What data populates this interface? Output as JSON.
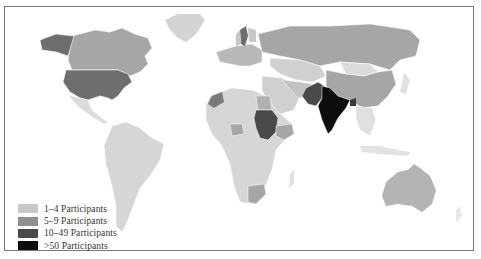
{
  "map": {
    "type": "choropleth world map",
    "subject": "Participants by country"
  },
  "legend": {
    "items": [
      {
        "label": "1–4 Participants",
        "color": "#c8c8c8"
      },
      {
        "label": "5–9 Participants",
        "color": "#8f8f8f"
      },
      {
        "label": "10–49 Participants",
        "color": "#4a4a4a"
      },
      {
        "label": ">50 Participants",
        "color": "#0d0d0d"
      }
    ]
  },
  "colors": {
    "no_data": "#ececec",
    "tier1": "#c8c8c8",
    "tier2": "#a6a6a6",
    "tier3": "#4a4a4a",
    "tier4": "#0d0d0d",
    "frame": "#7a7a7a"
  },
  "regions": [
    {
      "name": "United States",
      "tier": "10–49 Participants"
    },
    {
      "name": "Alaska",
      "tier": "10–49 Participants"
    },
    {
      "name": "Canada",
      "tier": "5–9 Participants"
    },
    {
      "name": "Mexico",
      "tier": "1–4 Participants"
    },
    {
      "name": "South America",
      "tier": "1–4 Participants"
    },
    {
      "name": "Russia",
      "tier": "5–9 Participants"
    },
    {
      "name": "China",
      "tier": "5–9 Participants"
    },
    {
      "name": "Mongolia",
      "tier": "1–4 Participants"
    },
    {
      "name": "India",
      "tier": ">50 Participants"
    },
    {
      "name": "Pakistan",
      "tier": "10–49 Participants"
    },
    {
      "name": "Sudan",
      "tier": "10–49 Participants"
    },
    {
      "name": "Ethiopia",
      "tier": "5–9 Participants"
    },
    {
      "name": "Nigeria",
      "tier": "5–9 Participants"
    },
    {
      "name": "South Africa",
      "tier": "5–9 Participants"
    },
    {
      "name": "Australia",
      "tier": "5–9 Participants"
    },
    {
      "name": "Sweden",
      "tier": "10–49 Participants"
    },
    {
      "name": "Morocco",
      "tier": "10–49 Participants"
    },
    {
      "name": "Egypt",
      "tier": "5–9 Participants"
    },
    {
      "name": "Bangladesh",
      "tier": "10–49 Participants"
    }
  ]
}
